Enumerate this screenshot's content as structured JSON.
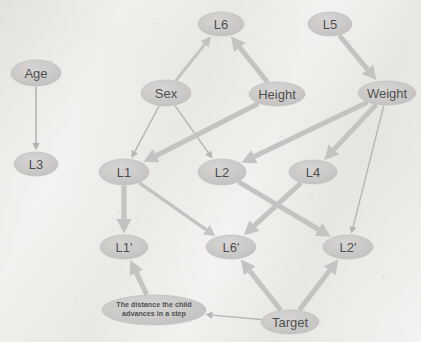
{
  "diagram": {
    "type": "directed-graph",
    "canvas": {
      "width": 421,
      "height": 342
    },
    "style": {
      "background_color": "#f3f2f0",
      "node_fill": "#c9c8c6",
      "node_fill_light": "#d3d2d0",
      "node_stroke": "#bfbebc",
      "node_text_color": "#4b4b4b",
      "edge_color": "#c4c3c1",
      "edge_color_thin": "#b6b5b3"
    },
    "nodes": [
      {
        "id": "age",
        "label": "Age",
        "x": 36,
        "y": 73,
        "rx": 25,
        "ry": 13,
        "shape": "ellipse",
        "kind": "plain"
      },
      {
        "id": "l3",
        "label": "L3",
        "x": 36,
        "y": 164,
        "rx": 22,
        "ry": 12,
        "shape": "ellipse",
        "kind": "plain"
      },
      {
        "id": "l6",
        "label": "L6",
        "x": 221,
        "y": 24,
        "rx": 23,
        "ry": 12,
        "shape": "ellipse",
        "kind": "plain"
      },
      {
        "id": "l5",
        "label": "L5",
        "x": 330,
        "y": 24,
        "rx": 22,
        "ry": 12,
        "shape": "ellipse",
        "kind": "plain"
      },
      {
        "id": "sex",
        "label": "Sex",
        "x": 166,
        "y": 93,
        "rx": 25,
        "ry": 13,
        "shape": "ellipse",
        "kind": "plain"
      },
      {
        "id": "height",
        "label": "Height",
        "x": 277,
        "y": 94,
        "rx": 28,
        "ry": 12,
        "shape": "ellipse",
        "kind": "plain"
      },
      {
        "id": "weight",
        "label": "Weight",
        "x": 387,
        "y": 93,
        "rx": 29,
        "ry": 12,
        "shape": "ellipse",
        "kind": "plain"
      },
      {
        "id": "l1",
        "label": "L1",
        "x": 124,
        "y": 172,
        "rx": 25,
        "ry": 13,
        "shape": "ellipse",
        "kind": "plain"
      },
      {
        "id": "l2",
        "label": "L2",
        "x": 222,
        "y": 172,
        "rx": 24,
        "ry": 13,
        "shape": "ellipse",
        "kind": "plain"
      },
      {
        "id": "l4",
        "label": "L4",
        "x": 313,
        "y": 172,
        "rx": 24,
        "ry": 12,
        "shape": "ellipse",
        "kind": "plain"
      },
      {
        "id": "l1prime",
        "label": "L1'",
        "x": 124,
        "y": 247,
        "rx": 24,
        "ry": 12,
        "shape": "ellipse",
        "kind": "plain"
      },
      {
        "id": "l6prime",
        "label": "L6'",
        "x": 231,
        "y": 247,
        "rx": 25,
        "ry": 12,
        "shape": "ellipse",
        "kind": "plain"
      },
      {
        "id": "l2prime",
        "label": "L2'",
        "x": 348,
        "y": 247,
        "rx": 25,
        "ry": 12,
        "shape": "ellipse",
        "kind": "plain"
      },
      {
        "id": "distance",
        "label": "The distance the child advances in a step",
        "x": 154,
        "y": 310,
        "rx": 52,
        "ry": 15,
        "shape": "ellipse",
        "kind": "note"
      },
      {
        "id": "target",
        "label": "Target",
        "x": 290,
        "y": 322,
        "rx": 29,
        "ry": 12,
        "shape": "ellipse",
        "kind": "plain"
      }
    ],
    "edges": [
      {
        "from": "age",
        "to": "l3",
        "weight": "thin",
        "width": 1.6
      },
      {
        "from": "sex",
        "to": "l6",
        "weight": "medium",
        "width": 3.0
      },
      {
        "from": "sex",
        "to": "l1",
        "weight": "thin",
        "width": 1.5
      },
      {
        "from": "sex",
        "to": "l2",
        "weight": "thin",
        "width": 1.5
      },
      {
        "from": "height",
        "to": "l6",
        "weight": "thick",
        "width": 5.0
      },
      {
        "from": "height",
        "to": "l1",
        "weight": "thick",
        "width": 5.0
      },
      {
        "from": "l5",
        "to": "weight",
        "weight": "thick",
        "width": 5.0
      },
      {
        "from": "weight",
        "to": "l2",
        "weight": "thick",
        "width": 5.0
      },
      {
        "from": "weight",
        "to": "l4",
        "weight": "thick",
        "width": 5.0
      },
      {
        "from": "weight",
        "to": "l2prime",
        "weight": "thin",
        "width": 1.4
      },
      {
        "from": "l1",
        "to": "l1prime",
        "weight": "thick",
        "width": 5.2
      },
      {
        "from": "l1",
        "to": "l6prime",
        "weight": "medium",
        "width": 3.4
      },
      {
        "from": "l2",
        "to": "l2prime",
        "weight": "thick",
        "width": 5.0
      },
      {
        "from": "l4",
        "to": "l6prime",
        "weight": "thick",
        "width": 5.0
      },
      {
        "from": "target",
        "to": "l6prime",
        "weight": "thick",
        "width": 5.0
      },
      {
        "from": "target",
        "to": "l2prime",
        "weight": "thick",
        "width": 5.0
      },
      {
        "from": "target",
        "to": "distance",
        "weight": "thin",
        "width": 1.4
      },
      {
        "from": "distance",
        "to": "l1prime",
        "weight": "thick",
        "width": 5.0
      }
    ]
  }
}
